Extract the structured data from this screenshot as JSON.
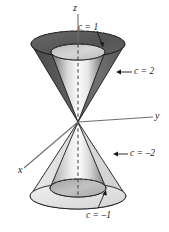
{
  "figure": {
    "type": "diagram",
    "background_color": "#ffffff",
    "line_color": "#1a1a1a"
  },
  "axes": {
    "z_label": "z",
    "y_label": "y",
    "x_label": "x",
    "origin": {
      "x": 78,
      "y": 122
    }
  },
  "levels": [
    {
      "name": "c-equals-1",
      "label": "c = 1",
      "nappe": "upper",
      "position": "inner",
      "fill": "#cfcfcf"
    },
    {
      "name": "c-equals-2",
      "label": "c = 2",
      "nappe": "upper",
      "position": "outer",
      "fill": "#616161"
    },
    {
      "name": "c-equals-minus-2",
      "label": "c = –2",
      "nappe": "lower",
      "position": "outer",
      "fill": "#dcdcdc"
    },
    {
      "name": "c-equals-minus-1",
      "label": "c = –1",
      "nappe": "lower",
      "position": "inner",
      "fill": "#a8a8a8"
    }
  ],
  "colors": {
    "outer_upper_dark": "#4a4a4a",
    "outer_upper_mid": "#6d6d6d",
    "outer_upper_top_face": "#5c5c5c",
    "inner_upper_light": "#f4f4f4",
    "inner_upper_dark": "#555555",
    "outer_lower_light": "#e2e2e2",
    "inner_lower_mid": "#b4b4b4",
    "stroke": "#1a1a1a",
    "dashed_axis": "#3a3a3a"
  }
}
